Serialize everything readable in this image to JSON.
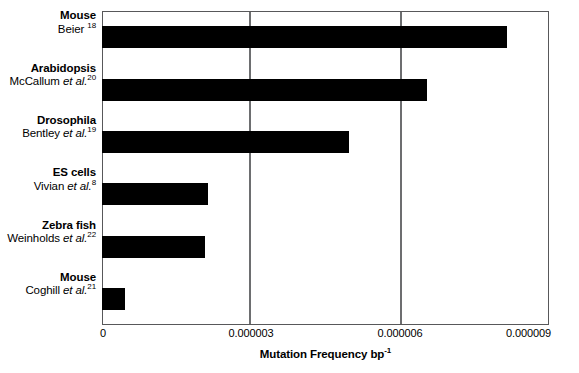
{
  "chart_data": {
    "type": "bar",
    "orientation": "horizontal",
    "title": "",
    "xlabel": "Mutation Frequency bp-1",
    "xlabel_parts": {
      "text": "Mutation Frequency bp",
      "sup": "-1"
    },
    "ylabel": "",
    "xlim": [
      0,
      9e-06
    ],
    "xticks": [
      0,
      3e-06,
      6e-06,
      9e-06
    ],
    "xtick_labels": [
      "0",
      "0.000003",
      "0.000006",
      "0.000009"
    ],
    "grid": "vertical-at-xticks",
    "legend": "none",
    "bar_color": "#000000",
    "categories": [
      "Mouse Beier18",
      "Arabidopsis McCallum et al.20",
      "Drosophila Bentley et al.19",
      "ES cells Vivian et al.8",
      "Zebra fish Weinholds et al.22",
      "Mouse Coghill et al.21"
    ],
    "values": [
      8.15e-06,
      6.54e-06,
      4.97e-06,
      2.13e-06,
      2.07e-06,
      4.6e-07
    ],
    "points": [
      {
        "organism": "Mouse",
        "author": "Beier",
        "etal": false,
        "ref": "18",
        "value": 8.15e-06
      },
      {
        "organism": "Arabidopsis",
        "author": "McCallum",
        "etal": true,
        "ref": "20",
        "value": 6.54e-06
      },
      {
        "organism": "Drosophila",
        "author": "Bentley",
        "etal": true,
        "ref": "19",
        "value": 4.97e-06
      },
      {
        "organism": "ES cells",
        "author": "Vivian",
        "etal": true,
        "ref": "8",
        "value": 2.13e-06
      },
      {
        "organism": "Zebra fish",
        "author": "Weinholds",
        "etal": true,
        "ref": "22",
        "value": 2.07e-06
      },
      {
        "organism": "Mouse",
        "author": "Coghill",
        "etal": true,
        "ref": "21",
        "value": 4.6e-07
      }
    ]
  }
}
